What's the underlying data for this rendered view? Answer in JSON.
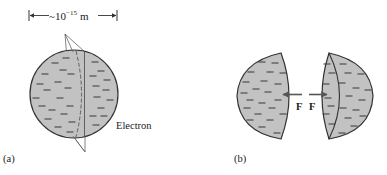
{
  "panel_a": {
    "label": "(a)",
    "scale_prefix": "~10",
    "scale_exponent": "−15",
    "scale_unit": "m",
    "object_label": "Electron"
  },
  "panel_b": {
    "label": "(b)",
    "force_left": "F",
    "force_right": "F"
  },
  "colors": {
    "fill": "#c2c2c2",
    "outline": "#333333",
    "charge": "#444444",
    "arrow": "#555555"
  }
}
